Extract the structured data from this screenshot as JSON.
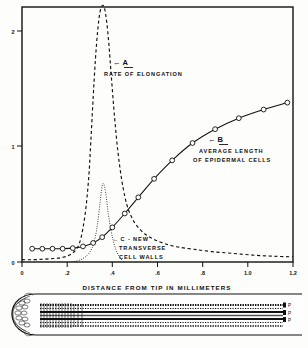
{
  "figure": {
    "background_color": "#fdfdfb",
    "ink_color": "#111111"
  },
  "chart_data": {
    "type": "line",
    "title": "",
    "xlabel": "DISTANCE  FROM  TIP  IN  MILLIMETERS",
    "ylabel": "",
    "xlim": [
      0,
      1.2
    ],
    "ylim": [
      0,
      2.3
    ],
    "grid": false,
    "legend_position": "inline-annotations",
    "xticks": [
      0,
      0.2,
      0.4,
      0.6,
      0.8,
      1.0,
      1.2
    ],
    "xticklabels": [
      "0",
      ".2",
      ".4",
      ".6",
      ".8",
      "1.0",
      "1.2"
    ],
    "yticks": [
      0,
      1,
      2
    ],
    "yticklabels": [
      "0",
      "1",
      "2"
    ],
    "series": [
      {
        "name": "A",
        "label": "RATE OF ELONGATION",
        "style": "dashed",
        "marker": "none",
        "x": [
          0.0,
          0.05,
          0.1,
          0.14,
          0.18,
          0.21,
          0.24,
          0.26,
          0.28,
          0.295,
          0.305,
          0.315,
          0.325,
          0.335,
          0.345,
          0.355,
          0.365,
          0.375,
          0.385,
          0.395,
          0.41,
          0.425,
          0.44,
          0.455,
          0.47,
          0.49,
          0.51,
          0.54,
          0.58,
          0.63,
          0.69,
          0.76,
          0.84,
          0.93,
          1.02,
          1.11,
          1.2
        ],
        "y": [
          0.02,
          0.02,
          0.025,
          0.03,
          0.04,
          0.06,
          0.11,
          0.2,
          0.42,
          0.72,
          1.05,
          1.42,
          1.75,
          2.0,
          2.16,
          2.22,
          2.2,
          2.08,
          1.88,
          1.62,
          1.25,
          0.95,
          0.73,
          0.57,
          0.46,
          0.37,
          0.31,
          0.25,
          0.2,
          0.16,
          0.13,
          0.11,
          0.09,
          0.075,
          0.06,
          0.05,
          0.045
        ]
      },
      {
        "name": "B",
        "label": "AVERAGE LENGTH OF EPIDERMAL CELLS",
        "style": "solid",
        "marker": "circle",
        "x": [
          0.045,
          0.09,
          0.135,
          0.18,
          0.225,
          0.27,
          0.315,
          0.355,
          0.4,
          0.455,
          0.515,
          0.585,
          0.665,
          0.755,
          0.855,
          0.96,
          1.07,
          1.175
        ],
        "y": [
          0.115,
          0.115,
          0.115,
          0.115,
          0.12,
          0.135,
          0.165,
          0.215,
          0.3,
          0.42,
          0.56,
          0.72,
          0.88,
          1.03,
          1.15,
          1.245,
          1.32,
          1.38
        ]
      },
      {
        "name": "C",
        "label": "C - NEW TRANSVERSE CELL WALLS",
        "style": "dotted",
        "marker": "none",
        "x": [
          0.22,
          0.26,
          0.29,
          0.31,
          0.325,
          0.335,
          0.345,
          0.352,
          0.358,
          0.366,
          0.374,
          0.382,
          0.392,
          0.402,
          0.415,
          0.43,
          0.45
        ],
        "y": [
          0.0,
          0.02,
          0.06,
          0.12,
          0.22,
          0.34,
          0.5,
          0.62,
          0.68,
          0.65,
          0.55,
          0.42,
          0.3,
          0.2,
          0.11,
          0.05,
          0.0
        ]
      }
    ],
    "annotations": [
      {
        "id": "annotation-a",
        "letter": "A",
        "arrow": "←",
        "lines": [
          "RATE  OF  ELONGATION"
        ],
        "x_px": 118,
        "y_px": 62
      },
      {
        "id": "annotation-b",
        "letter": "B",
        "arrow": "←",
        "lines": [
          "AVERAGE   LENGTH",
          "OF   EPIDERMAL   CELLS"
        ],
        "x_px": 213,
        "y_px": 140
      },
      {
        "id": "annotation-c",
        "letter": "C - NEW",
        "arrow": "←",
        "lines": [
          "TRANSVERSE",
          "CELL  WALLS"
        ],
        "x_px": 118,
        "y_px": 238
      }
    ]
  },
  "root_diagram": {
    "name": "root-tip-longitudinal-section",
    "description": "Longitudinal section of a root tip aligned to the distance axis above",
    "labels": [
      {
        "id": "label-p1",
        "text": "P"
      },
      {
        "id": "label-p2",
        "text": "P"
      },
      {
        "id": "label-p3",
        "text": "P"
      }
    ]
  }
}
